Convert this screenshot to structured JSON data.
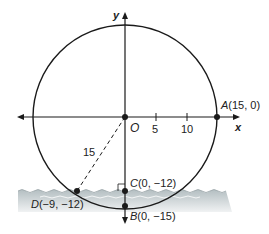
{
  "diagram": {
    "axes": {
      "x_label": "x",
      "y_label": "y",
      "ticks": [
        "5",
        "10"
      ]
    },
    "points": {
      "origin": {
        "label": "O"
      },
      "A": {
        "name": "A",
        "coords": "(15, 0)"
      },
      "B": {
        "name": "B",
        "coords": "(0, −15)"
      },
      "C": {
        "name": "C",
        "coords": "(0, −12)"
      },
      "D": {
        "name": "D",
        "coords": "(−9, −12)"
      }
    },
    "radius_label": "15",
    "colors": {
      "line": "#1a1a1a",
      "water_top": "#b9c3c6",
      "water_bottom": "#e8eced"
    }
  }
}
